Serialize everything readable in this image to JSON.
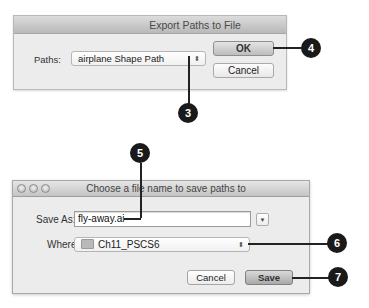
{
  "export_dialog": {
    "title": "Export Paths to File",
    "paths_label": "Paths:",
    "paths_value": "airplane Shape Path",
    "popup_arrows": "⬍",
    "ok_label": "OK",
    "cancel_label": "Cancel"
  },
  "save_dialog": {
    "title": "Choose a file name to save paths to",
    "save_as_label": "Save As:",
    "save_as_value": "fly-away.ai",
    "disclosure_glyph": "▼",
    "where_label": "Where:",
    "where_value": "Ch11_PSCS6",
    "popup_arrows": "⬍",
    "cancel_label": "Cancel",
    "save_label": "Save"
  },
  "callouts": [
    {
      "number": "3"
    },
    {
      "number": "4"
    },
    {
      "number": "5"
    },
    {
      "number": "6"
    },
    {
      "number": "7"
    }
  ]
}
